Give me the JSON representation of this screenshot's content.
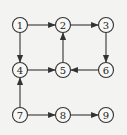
{
  "diagram": {
    "type": "directed-graph",
    "nodes": [
      {
        "id": "1",
        "label": "1",
        "x": 20,
        "y": 25
      },
      {
        "id": "2",
        "label": "2",
        "x": 63,
        "y": 25
      },
      {
        "id": "3",
        "label": "3",
        "x": 106,
        "y": 25
      },
      {
        "id": "4",
        "label": "4",
        "x": 20,
        "y": 70
      },
      {
        "id": "5",
        "label": "5",
        "x": 63,
        "y": 70
      },
      {
        "id": "6",
        "label": "6",
        "x": 106,
        "y": 70
      },
      {
        "id": "7",
        "label": "7",
        "x": 20,
        "y": 115
      },
      {
        "id": "8",
        "label": "8",
        "x": 63,
        "y": 115
      },
      {
        "id": "9",
        "label": "9",
        "x": 106,
        "y": 115
      }
    ],
    "edges": [
      {
        "from": "1",
        "to": "2"
      },
      {
        "from": "2",
        "to": "3"
      },
      {
        "from": "1",
        "to": "4"
      },
      {
        "from": "3",
        "to": "6"
      },
      {
        "from": "6",
        "to": "5"
      },
      {
        "from": "4",
        "to": "5"
      },
      {
        "from": "5",
        "to": "2"
      },
      {
        "from": "7",
        "to": "4"
      },
      {
        "from": "7",
        "to": "8"
      },
      {
        "from": "8",
        "to": "9"
      }
    ],
    "node_radius": 7.5,
    "colors": {
      "stroke": "#333333",
      "background": "#f3f3f1"
    }
  }
}
